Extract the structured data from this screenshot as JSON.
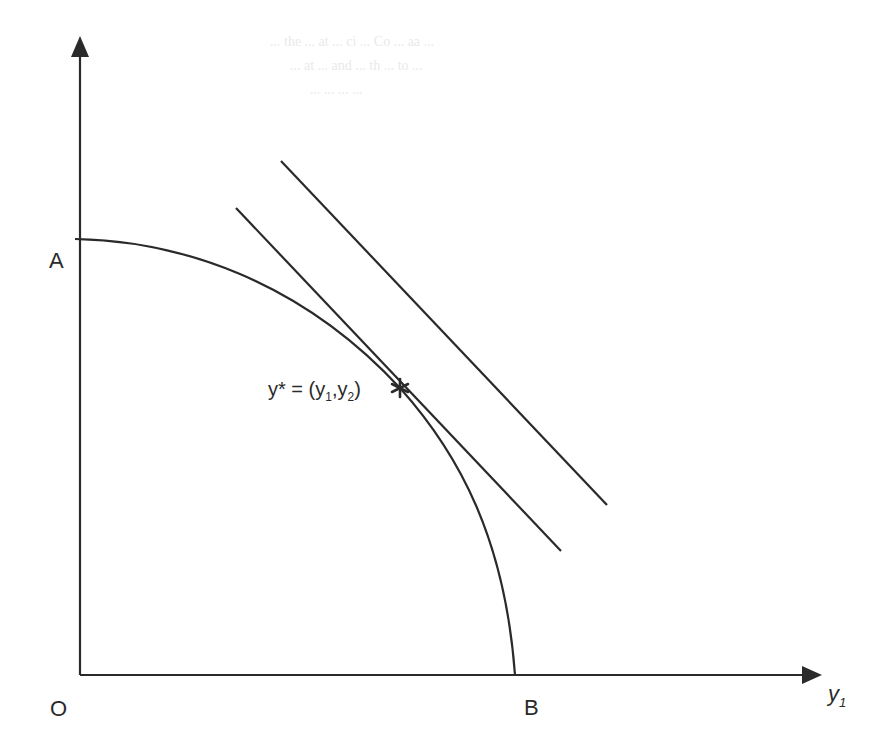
{
  "figure": {
    "type": "production possibility frontier diagram",
    "stroke_color": "#2a2a2a",
    "background": "#ffffff"
  },
  "axes": {
    "origin_label": "O",
    "x_axis_label": "y",
    "x_axis_subscript": "1",
    "y_axis_label": ""
  },
  "points": {
    "A": "A",
    "B": "B",
    "optimum": {
      "prefix": "y* = (y",
      "sub1": "1",
      "mid": ",y",
      "sub2": "2",
      "suffix": ")",
      "marker": "✱"
    }
  },
  "curves": {
    "frontier": "concave frontier from A to B",
    "tangent_line": "isorevenue line tangent at y*",
    "outer_line": "higher parallel isorevenue line"
  },
  "bleed_through_text": [
    "... the ... at ... ci ... Co ... aa ...",
    "... at ... and ... th ... to ...",
    "... ... ... ..."
  ]
}
